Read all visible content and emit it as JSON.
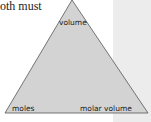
{
  "body_text": "oth must",
  "triangle": {
    "fill": "#d3d3d3",
    "stroke": "#555555",
    "top_label": "volume",
    "bottom_left_label": "moles",
    "bottom_right_label": "molar volume"
  },
  "side_panel": {
    "color": "#ececec"
  }
}
